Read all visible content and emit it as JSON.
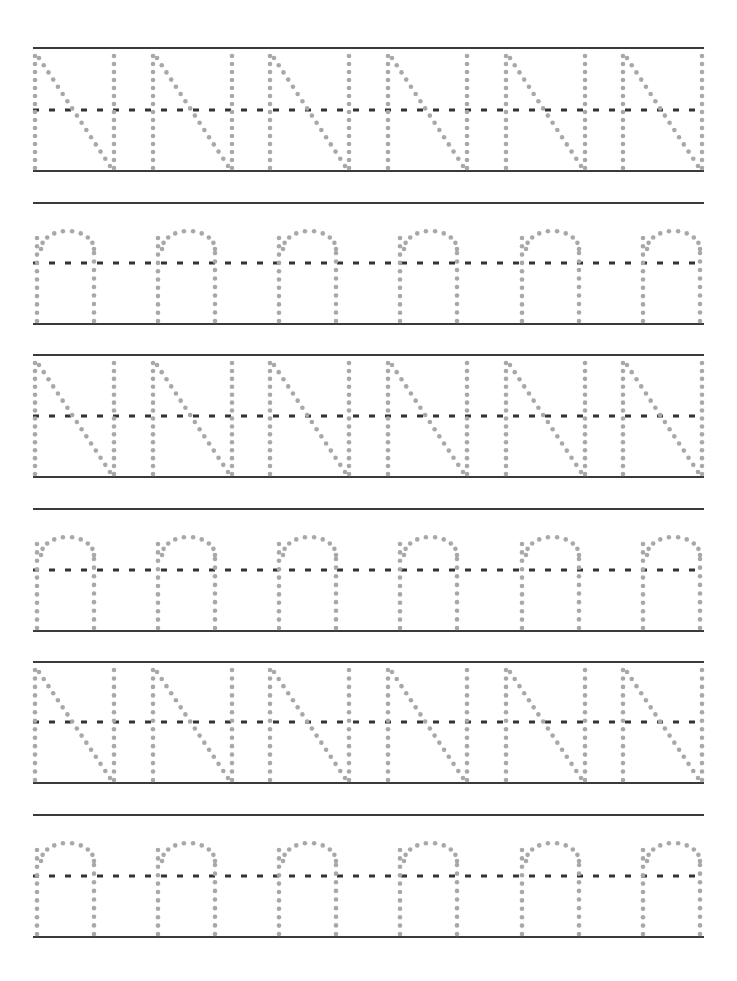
{
  "worksheet": {
    "title": "Letter N tracing practice",
    "line_color": "#3a3a3a",
    "dot_color": "#a8a8a8",
    "dash_color": "#333333",
    "line_left": 33,
    "line_right": 704,
    "rows": [
      {
        "letter": "N",
        "case": "upper",
        "top": 48,
        "mid": 110,
        "base": 171,
        "count": 6
      },
      {
        "letter": "n",
        "case": "lower",
        "top": 203,
        "mid": 263,
        "base": 324,
        "count": 6
      },
      {
        "letter": "N",
        "case": "upper",
        "top": 355,
        "mid": 416,
        "base": 477,
        "count": 6
      },
      {
        "letter": "n",
        "case": "lower",
        "top": 509,
        "mid": 570,
        "base": 631,
        "count": 6
      },
      {
        "letter": "N",
        "case": "upper",
        "top": 662,
        "mid": 722,
        "base": 783,
        "count": 6
      },
      {
        "letter": "n",
        "case": "lower",
        "top": 815,
        "mid": 876,
        "base": 937,
        "count": 6
      }
    ],
    "upper_x": [
      35,
      153,
      270,
      388,
      506,
      623
    ],
    "upper_width": 79,
    "lower_x": [
      37,
      158,
      279,
      400,
      522,
      643
    ],
    "lower_width": 57
  }
}
